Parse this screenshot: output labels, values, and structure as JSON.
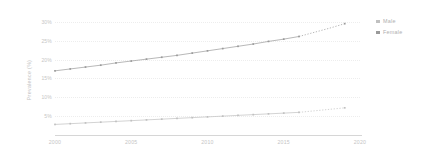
{
  "chart_data": {
    "type": "line",
    "title": "",
    "subtitle": "",
    "xlabel": "",
    "ylabel": "Prevalence (%)",
    "xlim": [
      2000,
      2020
    ],
    "ylim": [
      0,
      31
    ],
    "grid": true,
    "legend_position": "right",
    "x": [
      2000,
      2001,
      2002,
      2003,
      2004,
      2005,
      2006,
      2007,
      2008,
      2009,
      2010,
      2011,
      2012,
      2013,
      2014,
      2015,
      2016,
      2017,
      2018,
      2019
    ],
    "x_tick_labels": [
      "2000",
      "2005",
      "2010",
      "2015",
      "2020"
    ],
    "x_tick_values": [
      2000,
      2005,
      2010,
      2015,
      2020
    ],
    "y_tick_labels": [
      "5%",
      "10%",
      "15%",
      "20%",
      "25%",
      "30%"
    ],
    "y_tick_values": [
      5,
      10,
      15,
      20,
      25,
      30
    ],
    "projection_starts_at": 2016,
    "series": [
      {
        "name": "Female",
        "color": "#9a9a9a",
        "marker": "square",
        "values": [
          17.0,
          17.5,
          18.0,
          18.5,
          19.1,
          19.6,
          20.1,
          20.6,
          21.1,
          21.7,
          22.3,
          22.9,
          23.5,
          24.1,
          24.8,
          25.4,
          26.1,
          27.2,
          28.3,
          29.5
        ],
        "projected_from_index": 16
      },
      {
        "name": "Male",
        "color": "#c0c0c0",
        "marker": "square",
        "values": [
          2.8,
          3.0,
          3.2,
          3.4,
          3.6,
          3.8,
          4.0,
          4.2,
          4.4,
          4.6,
          4.8,
          5.0,
          5.2,
          5.4,
          5.6,
          5.8,
          6.0,
          6.4,
          6.8,
          7.2
        ],
        "projected_from_index": 16
      }
    ],
    "legend": [
      {
        "label": "Male",
        "color": "#c0c0c0"
      },
      {
        "label": "Female",
        "color": "#9a9a9a"
      }
    ]
  },
  "axes": {
    "y_title": "Prevalence (%)"
  },
  "colors": {
    "grid": "#ededed",
    "axis": "#d6d6d6",
    "text": "#c5c5c5",
    "female": "#9a9a9a",
    "male": "#c0c0c0"
  }
}
